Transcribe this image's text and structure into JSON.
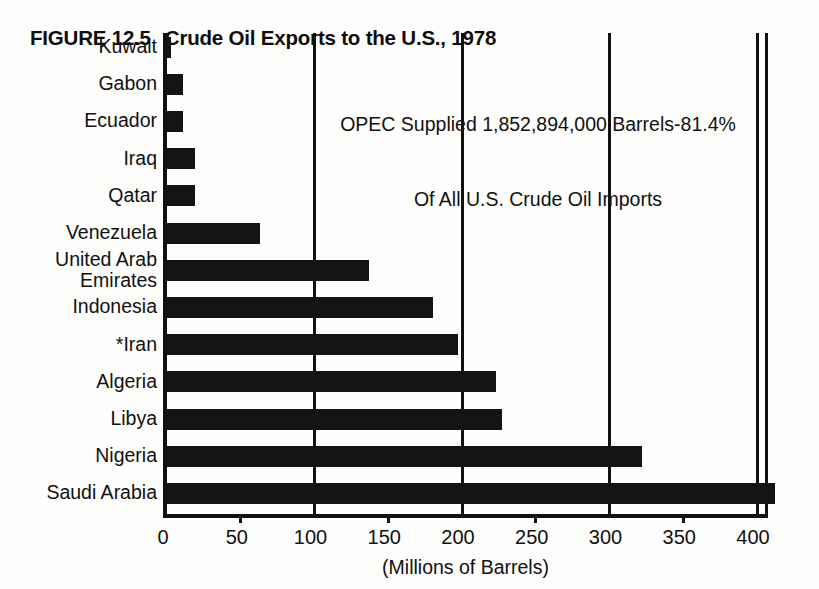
{
  "title": {
    "figure_number": "FIGURE 12.5",
    "text": "Crude Oil Exports to the U.S., 1978"
  },
  "annotation": {
    "line1": "OPEC Supplied 1,852,894,000 Barrels-81.4%",
    "line2": "Of All U.S. Crude Oil Imports"
  },
  "footnote_marker": "*",
  "colors": {
    "bar": "#141414",
    "axis": "#111111",
    "background": "#fdfdfb"
  },
  "chart_data": {
    "type": "bar",
    "orientation": "horizontal",
    "xlabel": "(Millions of Barrels)",
    "ylabel": "",
    "xlim": [
      0,
      410
    ],
    "grid": true,
    "legend": null,
    "xticks": [
      0,
      50,
      100,
      150,
      200,
      250,
      300,
      350,
      400
    ],
    "xtick_labels": [
      "0",
      "50",
      "100",
      "150",
      "200",
      "250",
      "300",
      "350",
      "400"
    ],
    "gridlines_at": [
      100,
      200,
      300,
      400
    ],
    "categories": [
      "Kuwait",
      "Gabon",
      "Ecuador",
      "Iraq",
      "Qatar",
      "Venezuela",
      "United Arab Emirates",
      "Indonesia",
      "*Iran",
      "Algeria",
      "Libya",
      "Nigeria",
      "Saudi Arabia"
    ],
    "category_labels": [
      "Kuwait",
      "Gabon",
      "Ecuador",
      "Iraq",
      "Qatar",
      "Venezuela",
      "United Arab\nEmirates",
      "Indonesia",
      "*Iran",
      "Algeria",
      "Libya",
      "Nigeria",
      "Saudi Arabia"
    ],
    "values": [
      3,
      11,
      11,
      19,
      19,
      63,
      137,
      180,
      197,
      223,
      227,
      322,
      412
    ],
    "units": "millions of barrels",
    "annotations": [
      "OPEC Supplied 1,852,894,000 Barrels-81.4%",
      "Of All U.S. Crude Oil Imports"
    ]
  }
}
